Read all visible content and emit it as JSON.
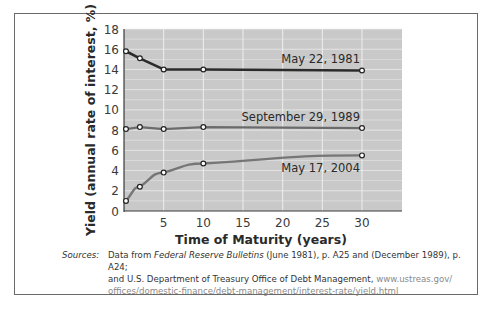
{
  "chart_data": {
    "type": "line",
    "title": "",
    "xlabel": "Time of Maturity (years)",
    "ylabel": "Yield (annual rate of interest, %)",
    "xlim": [
      0,
      35
    ],
    "ylim": [
      0,
      18
    ],
    "xticks": [
      5,
      10,
      15,
      20,
      25,
      30
    ],
    "yticks": [
      0,
      2,
      4,
      6,
      8,
      10,
      12,
      14,
      16,
      18
    ],
    "grid": true,
    "legend": "inline-labels",
    "series": [
      {
        "name": "May 22, 1981",
        "color": "#2b2b2b",
        "x": [
          0.25,
          2,
          5,
          10,
          30
        ],
        "y": [
          15.8,
          15.1,
          14.0,
          14.0,
          13.9
        ]
      },
      {
        "name": "September 29, 1989",
        "color": "#6b6b6b",
        "x": [
          0.25,
          2,
          5,
          10,
          30
        ],
        "y": [
          8.1,
          8.3,
          8.1,
          8.3,
          8.2
        ]
      },
      {
        "name": "May 17, 2004",
        "color": "#767676",
        "x": [
          0.25,
          2,
          5,
          10,
          30
        ],
        "y": [
          1.0,
          2.4,
          3.8,
          4.7,
          5.5
        ]
      }
    ]
  },
  "colors": {
    "plot_background": "#c9c9c9",
    "gridline": "#eeeeee",
    "frame": "#6a6a6a"
  },
  "sources": {
    "label": "Sources:",
    "line1_prefix": "Data from ",
    "line1_italic": "Federal Reserve Bulletins",
    "line1_suffix": " (June 1981), p. A25 and (December 1989), p. A24;",
    "line2": "and U.S. Department of Treasury Office of Debt Management, ",
    "line2_url": "www.ustreas.gov/",
    "line3_url": "offices/domestic-finance/debt-management/interest-rate/yield.html"
  }
}
